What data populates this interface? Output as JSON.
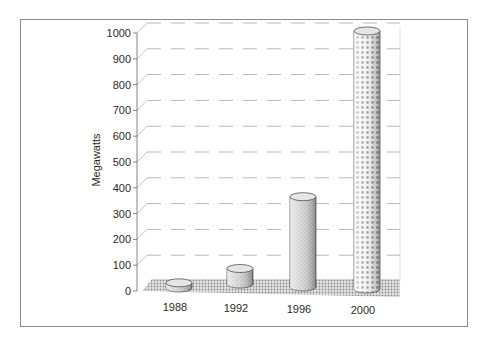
{
  "chart_data": {
    "type": "bar",
    "style": "3d-cylinder",
    "title": "",
    "xlabel": "",
    "ylabel": "Megawatts",
    "categories": [
      "1988",
      "1992",
      "1996",
      "2000"
    ],
    "values": [
      20,
      60,
      350,
      1000
    ],
    "ylim": [
      0,
      1000
    ],
    "yticks": [
      "0",
      "100",
      "200",
      "300",
      "400",
      "500",
      "600",
      "700",
      "800",
      "900",
      "1000"
    ],
    "grid": true,
    "legend": null
  },
  "colors": {
    "frame": "#8a8a8a",
    "floor": "#bdbdbd",
    "grid": "#9a9a9a",
    "bar_fill": "#d8d8d8",
    "bar_stroke": "#555555"
  }
}
